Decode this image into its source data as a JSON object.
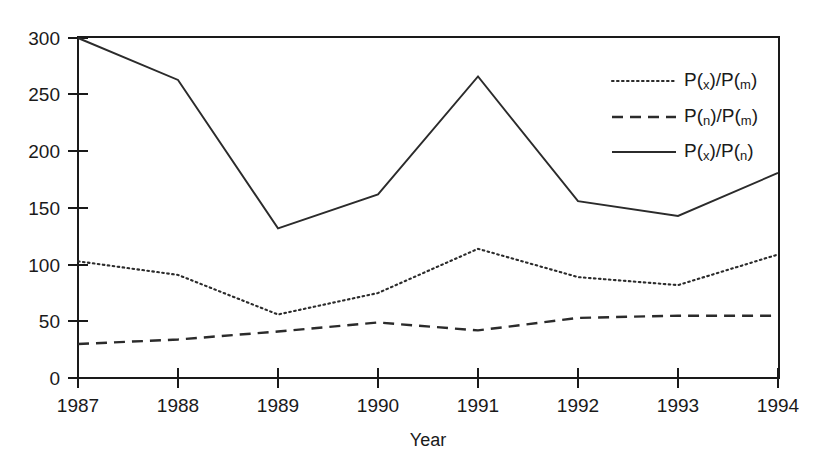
{
  "chart_data": {
    "type": "line",
    "title": "",
    "xlabel": "Year",
    "ylabel": "",
    "categories": [
      "1987",
      "1988",
      "1989",
      "1990",
      "1991",
      "1992",
      "1993",
      "1994"
    ],
    "x": [
      1987,
      1988,
      1989,
      1990,
      1991,
      1992,
      1993,
      1994
    ],
    "xlim": [
      1987,
      1994
    ],
    "ylim": [
      0,
      300
    ],
    "yticks": [
      0,
      50,
      100,
      150,
      200,
      250,
      300
    ],
    "xticks": [
      "1987",
      "1988",
      "1989",
      "1990",
      "1991",
      "1992",
      "1993",
      "1994"
    ],
    "grid": false,
    "legend_position": "upper right",
    "series": [
      {
        "name": "P(x)/P(m)",
        "name_parts": {
          "p1": "P(",
          "sub1": "x",
          "mid": ")/P(",
          "sub2": "m",
          "end": ")"
        },
        "style": "dotted",
        "values": [
          103,
          91,
          56,
          75,
          114,
          89,
          82,
          109
        ]
      },
      {
        "name": "P(n)/P(m)",
        "name_parts": {
          "p1": "P(",
          "sub1": "n",
          "mid": ")/P(",
          "sub2": "m",
          "end": ")"
        },
        "style": "dashed",
        "values": [
          30,
          34,
          41,
          49,
          42,
          53,
          55,
          55
        ]
      },
      {
        "name": "P(x)/P(n)",
        "name_parts": {
          "p1": "P(",
          "sub1": "x",
          "mid": ")/P(",
          "sub2": "n",
          "end": ")"
        },
        "style": "solid",
        "values": [
          300,
          263,
          132,
          162,
          266,
          156,
          143,
          181
        ]
      }
    ]
  },
  "axes": {
    "y_tick_labels": [
      "0",
      "50",
      "100",
      "150",
      "200",
      "250",
      "300"
    ],
    "x_tick_labels": [
      "1987",
      "1988",
      "1989",
      "1990",
      "1991",
      "1992",
      "1993",
      "1994"
    ],
    "x_axis_title": "Year"
  },
  "legend": {
    "items": [
      {
        "label": "P(x)/P(m)",
        "style": "dotted"
      },
      {
        "label": "P(n)/P(m)",
        "style": "dashed"
      },
      {
        "label": "P(x)/P(n)",
        "style": "solid"
      }
    ]
  }
}
